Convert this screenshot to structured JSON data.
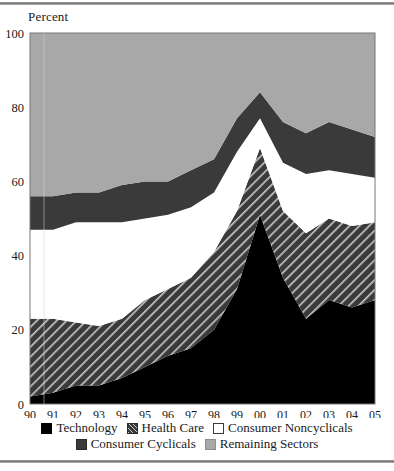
{
  "figure": {
    "y_axis_title": "Percent",
    "top_rule": "horizontal-rule",
    "bottom_rule": "horizontal-rule"
  },
  "legend": {
    "rows": [
      [
        {
          "label": "Technology",
          "swatch": "black-solid",
          "key": "technology"
        },
        {
          "label": "Health Care",
          "swatch": "diagonal-hatch",
          "key": "health_care"
        },
        {
          "label": "Consumer Noncyclicals",
          "swatch": "white-outline",
          "key": "consumer_noncyclicals"
        }
      ],
      [
        {
          "label": "Consumer Cyclicals",
          "swatch": "dark-gray-solid",
          "key": "consumer_cyclicals"
        },
        {
          "label": "Remaining Sectors",
          "swatch": "light-gray-solid",
          "key": "remaining_sectors"
        }
      ]
    ]
  },
  "colors": {
    "technology": "#000000",
    "health_care": "#3a3a3a",
    "health_care_hatch": "#c9c9c9",
    "consumer_noncyclicals": "#ffffff",
    "consumer_cyclicals": "#3a3a3a",
    "remaining_sectors": "#a8a8a8",
    "axis": "#1a1a1a",
    "plot_border": "#777777"
  },
  "chart_data": {
    "type": "area",
    "stacked": true,
    "title": "",
    "xlabel": "",
    "ylabel": "Percent",
    "ylim": [
      0,
      100
    ],
    "yticks": [
      0,
      20,
      40,
      60,
      80,
      100
    ],
    "grid": false,
    "legend_position": "bottom",
    "x": [
      "90",
      "91",
      "92",
      "93",
      "94",
      "95",
      "96",
      "97",
      "98",
      "99",
      "00",
      "01",
      "02",
      "03",
      "04",
      "05"
    ],
    "categories": [
      "90",
      "91",
      "92",
      "93",
      "94",
      "95",
      "96",
      "97",
      "98",
      "99",
      "00",
      "01",
      "02",
      "03",
      "04",
      "05"
    ],
    "series": [
      {
        "name": "Technology",
        "key": "technology",
        "values": [
          2,
          3,
          5,
          5,
          7,
          10,
          13,
          15,
          20,
          31,
          51,
          34,
          23,
          28,
          26,
          28
        ]
      },
      {
        "name": "Health Care",
        "key": "health_care",
        "values": [
          21,
          20,
          17,
          16,
          16,
          18,
          18,
          19,
          21,
          21,
          18,
          18,
          23,
          22,
          22,
          21
        ]
      },
      {
        "name": "Consumer Noncyclicals",
        "key": "consumer_noncyclicals",
        "values": [
          24,
          24,
          27,
          28,
          26,
          22,
          20,
          19,
          16,
          16,
          8,
          13,
          16,
          13,
          14,
          12
        ]
      },
      {
        "name": "Consumer Cyclicals",
        "key": "consumer_cyclicals",
        "values": [
          9,
          9,
          8,
          8,
          10,
          10,
          9,
          10,
          9,
          9,
          7,
          11,
          11,
          13,
          12,
          11
        ]
      },
      {
        "name": "Remaining Sectors",
        "key": "remaining_sectors",
        "values": [
          44,
          44,
          43,
          43,
          41,
          40,
          40,
          37,
          34,
          23,
          16,
          24,
          27,
          24,
          26,
          28
        ]
      }
    ],
    "cumulative_tops": {
      "technology": [
        2,
        3,
        5,
        5,
        7,
        10,
        13,
        15,
        20,
        31,
        51,
        34,
        23,
        28,
        26,
        28
      ],
      "health_care": [
        23,
        23,
        22,
        21,
        23,
        28,
        31,
        34,
        41,
        52,
        69,
        52,
        46,
        50,
        48,
        49
      ],
      "consumer_noncyclicals": [
        47,
        47,
        49,
        49,
        49,
        50,
        51,
        53,
        57,
        68,
        77,
        65,
        62,
        63,
        62,
        61
      ],
      "consumer_cyclicals": [
        56,
        56,
        57,
        57,
        59,
        60,
        60,
        63,
        66,
        77,
        84,
        76,
        73,
        76,
        74,
        72
      ],
      "remaining_sectors": [
        100,
        100,
        100,
        100,
        100,
        100,
        100,
        100,
        100,
        100,
        100,
        100,
        100,
        100,
        100,
        100
      ]
    }
  }
}
